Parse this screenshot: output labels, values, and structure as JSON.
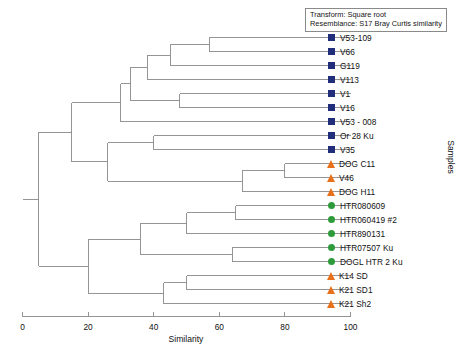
{
  "caption": {
    "line1": "Transform: Square root",
    "line2": "Resemblance: S17 Bray Curtis similarity"
  },
  "axes": {
    "x_title": "Similarity",
    "y_title": "Samples",
    "x_ticks": [
      0,
      20,
      40,
      60,
      80,
      100
    ],
    "x_min": 0,
    "x_max": 100
  },
  "colors": {
    "square": "#1f2d7a",
    "triangle": "#e8701a",
    "circle": "#2e9b3a",
    "line": "#8a8a8a",
    "text": "#111111",
    "background": "#ffffff"
  },
  "chart_data": {
    "type": "dendrogram",
    "title": "",
    "xlabel": "Similarity",
    "ylabel": "Samples",
    "xlim": [
      0,
      100
    ],
    "grid": false,
    "legend_position": "none",
    "orientation": "horizontal-right-leaves",
    "leaves": [
      {
        "label": "V53-109",
        "symbol": "square",
        "group": "V"
      },
      {
        "label": "V66",
        "symbol": "square",
        "group": "V"
      },
      {
        "label": "G119",
        "symbol": "square",
        "group": "V"
      },
      {
        "label": "V113",
        "symbol": "square",
        "group": "V"
      },
      {
        "label": "V1",
        "symbol": "square",
        "group": "V"
      },
      {
        "label": "V16",
        "symbol": "square",
        "group": "V"
      },
      {
        "label": "V53 - 008",
        "symbol": "square",
        "group": "V"
      },
      {
        "label": "Or 28 Ku",
        "symbol": "square",
        "group": "V"
      },
      {
        "label": "V35",
        "symbol": "square",
        "group": "V"
      },
      {
        "label": "DOG C11",
        "symbol": "triangle",
        "group": "DOG"
      },
      {
        "label": "V46",
        "symbol": "triangle",
        "group": "DOG"
      },
      {
        "label": "DOG H11",
        "symbol": "triangle",
        "group": "DOG"
      },
      {
        "label": "HTR080609",
        "symbol": "circle",
        "group": "HTR"
      },
      {
        "label": "HTR060419 #2",
        "symbol": "circle",
        "group": "HTR"
      },
      {
        "label": "HTR890131",
        "symbol": "circle",
        "group": "HTR"
      },
      {
        "label": "HTR07507 Ku",
        "symbol": "circle",
        "group": "HTR"
      },
      {
        "label": "DOGL HTR 2 Ku",
        "symbol": "circle",
        "group": "HTR"
      },
      {
        "label": "K14 SD",
        "symbol": "triangle",
        "group": "K"
      },
      {
        "label": "K21 SD1",
        "symbol": "triangle",
        "group": "K"
      },
      {
        "label": "K21 Sh2",
        "symbol": "triangle",
        "group": "K"
      }
    ],
    "merges": [
      {
        "id": "m1",
        "children": [
          "V53-109",
          "V66"
        ],
        "similarity": 57
      },
      {
        "id": "m2",
        "children": [
          "m1",
          "G119"
        ],
        "similarity": 45
      },
      {
        "id": "m3",
        "children": [
          "m2",
          "V113"
        ],
        "similarity": 38
      },
      {
        "id": "m4",
        "children": [
          "V1",
          "V16"
        ],
        "similarity": 48
      },
      {
        "id": "m5",
        "children": [
          "m3",
          "m4"
        ],
        "similarity": 33
      },
      {
        "id": "m6",
        "children": [
          "m5",
          "V53 - 008"
        ],
        "similarity": 30
      },
      {
        "id": "m7",
        "children": [
          "Or 28 Ku",
          "V35"
        ],
        "similarity": 40
      },
      {
        "id": "m8",
        "children": [
          "DOG C11",
          "V46"
        ],
        "similarity": 80
      },
      {
        "id": "m9",
        "children": [
          "m8",
          "DOG H11"
        ],
        "similarity": 67
      },
      {
        "id": "m10",
        "children": [
          "m7",
          "m9"
        ],
        "similarity": 26
      },
      {
        "id": "m11",
        "children": [
          "m6",
          "m10"
        ],
        "similarity": 15
      },
      {
        "id": "m12",
        "children": [
          "HTR080609",
          "HTR060419 #2"
        ],
        "similarity": 65
      },
      {
        "id": "m13",
        "children": [
          "m12",
          "HTR890131"
        ],
        "similarity": 50
      },
      {
        "id": "m14",
        "children": [
          "HTR07507 Ku",
          "DOGL HTR 2 Ku"
        ],
        "similarity": 64
      },
      {
        "id": "m15",
        "children": [
          "m13",
          "m14"
        ],
        "similarity": 36
      },
      {
        "id": "m16",
        "children": [
          "K14 SD",
          "K21 SD1"
        ],
        "similarity": 50
      },
      {
        "id": "m17",
        "children": [
          "m16",
          "K21 Sh2"
        ],
        "similarity": 43
      },
      {
        "id": "m18",
        "children": [
          "m15",
          "m17"
        ],
        "similarity": 20
      },
      {
        "id": "m19",
        "children": [
          "m11",
          "m18"
        ],
        "similarity": 5
      }
    ]
  }
}
